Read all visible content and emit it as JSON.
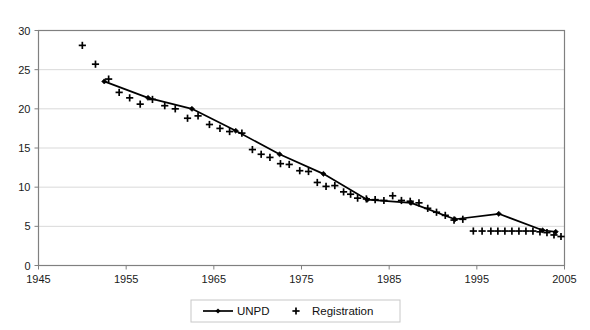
{
  "chart_data": {
    "type": "line",
    "title": "",
    "subtitle": "",
    "xlabel": "",
    "ylabel": "",
    "xlim": [
      1945,
      2005
    ],
    "ylim": [
      0,
      30
    ],
    "grid": true,
    "grid_axis": "y",
    "legend_position": "bottom",
    "x_ticks": [
      "1945",
      "1955",
      "1965",
      "1975",
      "1985",
      "1995",
      "2005"
    ],
    "x_tick_values": [
      1945,
      1955,
      1965,
      1975,
      1985,
      1995,
      2005
    ],
    "y_ticks": [
      "0",
      "5",
      "10",
      "15",
      "20",
      "25",
      "30"
    ],
    "y_tick_values": [
      0,
      5,
      10,
      15,
      20,
      25,
      30
    ],
    "series": [
      {
        "name": "UNPD",
        "marker": "diamond",
        "line": true,
        "color": "#000000",
        "points": [
          {
            "x": 1952.5,
            "y": 23.5
          },
          {
            "x": 1957.5,
            "y": 21.4
          },
          {
            "x": 1962.5,
            "y": 20.0
          },
          {
            "x": 1967.5,
            "y": 17.2
          },
          {
            "x": 1972.5,
            "y": 14.2
          },
          {
            "x": 1977.5,
            "y": 11.7
          },
          {
            "x": 1982.5,
            "y": 8.4
          },
          {
            "x": 1987.5,
            "y": 8.0
          },
          {
            "x": 1992.5,
            "y": 5.9
          },
          {
            "x": 1997.5,
            "y": 6.6
          },
          {
            "x": 2002.5,
            "y": 4.5
          },
          {
            "x": 2004.0,
            "y": 4.3
          }
        ]
      },
      {
        "name": "Registration",
        "marker": "plus",
        "line": false,
        "color": "#000000",
        "points": [
          {
            "x": 1950.0,
            "y": 28.1
          },
          {
            "x": 1951.5,
            "y": 25.7
          },
          {
            "x": 1953.0,
            "y": 23.8
          },
          {
            "x": 1954.2,
            "y": 22.1
          },
          {
            "x": 1955.4,
            "y": 21.4
          },
          {
            "x": 1956.6,
            "y": 20.6
          },
          {
            "x": 1958.0,
            "y": 21.2
          },
          {
            "x": 1959.4,
            "y": 20.4
          },
          {
            "x": 1960.6,
            "y": 20.0
          },
          {
            "x": 1962.0,
            "y": 18.8
          },
          {
            "x": 1963.2,
            "y": 19.1
          },
          {
            "x": 1964.5,
            "y": 18.0
          },
          {
            "x": 1965.7,
            "y": 17.5
          },
          {
            "x": 1966.8,
            "y": 17.1
          },
          {
            "x": 1968.2,
            "y": 16.9
          },
          {
            "x": 1969.4,
            "y": 14.8
          },
          {
            "x": 1970.4,
            "y": 14.2
          },
          {
            "x": 1971.4,
            "y": 13.8
          },
          {
            "x": 1972.6,
            "y": 13.0
          },
          {
            "x": 1973.6,
            "y": 12.9
          },
          {
            "x": 1974.8,
            "y": 12.1
          },
          {
            "x": 1975.8,
            "y": 12.0
          },
          {
            "x": 1976.8,
            "y": 10.6
          },
          {
            "x": 1977.8,
            "y": 10.1
          },
          {
            "x": 1978.8,
            "y": 10.2
          },
          {
            "x": 1979.8,
            "y": 9.4
          },
          {
            "x": 1980.6,
            "y": 9.1
          },
          {
            "x": 1981.4,
            "y": 8.6
          },
          {
            "x": 1982.4,
            "y": 8.5
          },
          {
            "x": 1983.4,
            "y": 8.4
          },
          {
            "x": 1984.4,
            "y": 8.3
          },
          {
            "x": 1985.4,
            "y": 8.9
          },
          {
            "x": 1986.4,
            "y": 8.3
          },
          {
            "x": 1987.4,
            "y": 8.2
          },
          {
            "x": 1988.4,
            "y": 8.0
          },
          {
            "x": 1989.4,
            "y": 7.3
          },
          {
            "x": 1990.4,
            "y": 6.8
          },
          {
            "x": 1991.4,
            "y": 6.4
          },
          {
            "x": 1992.4,
            "y": 5.8
          },
          {
            "x": 1993.4,
            "y": 5.9
          },
          {
            "x": 1994.6,
            "y": 4.4
          },
          {
            "x": 1995.6,
            "y": 4.4
          },
          {
            "x": 1996.6,
            "y": 4.4
          },
          {
            "x": 1997.4,
            "y": 4.4
          },
          {
            "x": 1998.2,
            "y": 4.4
          },
          {
            "x": 1999.0,
            "y": 4.4
          },
          {
            "x": 1999.8,
            "y": 4.4
          },
          {
            "x": 2000.6,
            "y": 4.4
          },
          {
            "x": 2001.4,
            "y": 4.4
          },
          {
            "x": 2002.2,
            "y": 4.3
          },
          {
            "x": 2003.0,
            "y": 4.2
          },
          {
            "x": 2003.8,
            "y": 3.9
          },
          {
            "x": 2004.6,
            "y": 3.7
          }
        ]
      }
    ]
  },
  "legend": {
    "entries": [
      {
        "label": "UNPD",
        "marker": "line-diamond"
      },
      {
        "label": "Registration",
        "marker": "plus"
      }
    ]
  },
  "colors": {
    "plot_border": "#808080",
    "gridline": "#d9d9d9",
    "series": "#000000",
    "text": "#1a1a1a",
    "background": "#ffffff",
    "legend_border": "#c8c8c8"
  }
}
